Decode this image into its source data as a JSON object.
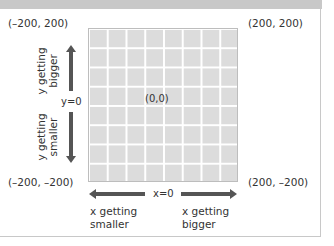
{
  "diagram": {
    "corners": {
      "top_left": "(–200, 200)",
      "top_right": "(200, 200)",
      "bottom_left": "(–200, –200)",
      "bottom_right": "(200, –200)"
    },
    "origin_label": "(0,0)",
    "x_axis": {
      "zero_label": "x=0",
      "left_caption": [
        "x getting",
        "smaller"
      ],
      "right_caption": [
        "x getting",
        "bigger"
      ]
    },
    "y_axis": {
      "zero_label": "y=0",
      "up_caption": [
        "y getting",
        "bigger"
      ],
      "down_caption": [
        "y getting",
        "smaller"
      ]
    },
    "grid": {
      "columns": 8,
      "rows": 8
    },
    "colors": {
      "grid_fill": "#dcdcdc",
      "grid_lines": "#ffffff",
      "arrow": "#555555",
      "top_band": "#c8c8c8"
    }
  }
}
